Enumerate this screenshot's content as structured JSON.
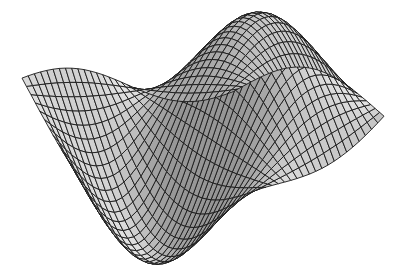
{
  "figure": {
    "kind": "3d-wireframe-surface",
    "description": "Hatched wireframe mesh of a wave-shaped surface (saddle-like, two raised humps and two drooping lips)",
    "background_color": "#ffffff",
    "mesh_line_color": "#1a1a1a",
    "fill_color": "#bdbdbd",
    "fill_shade_dark": "#8c8c8c",
    "fill_shade_light": "#d9d9d9",
    "grid_resolution": {
      "u": 34,
      "v": 34
    },
    "projection": {
      "width": 399,
      "height": 274
    },
    "has_axes": false,
    "has_labels": false
  }
}
